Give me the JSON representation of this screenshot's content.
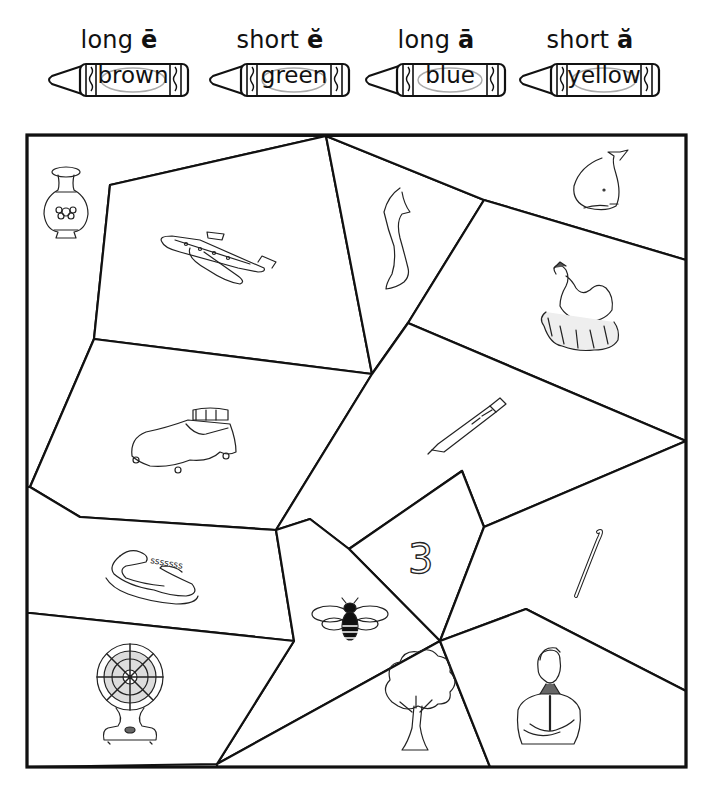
{
  "color_key": [
    {
      "sound": "long",
      "vowel": "ē",
      "color_word": "brown",
      "color": "#8B5A2B"
    },
    {
      "sound": "short",
      "vowel": "ĕ",
      "color_word": "green",
      "color": "#2E8B57"
    },
    {
      "sound": "long",
      "vowel": "ā",
      "color_word": "blue",
      "color": "#2F6FD6"
    },
    {
      "sound": "short",
      "vowel": "ă",
      "color_word": "yellow",
      "color": "#F2D21B"
    }
  ],
  "pictures": [
    {
      "name": "vase",
      "icon": "vase-icon"
    },
    {
      "name": "jet",
      "icon": "jet-icon"
    },
    {
      "name": "leg",
      "icon": "leg-icon"
    },
    {
      "name": "whale",
      "icon": "whale-icon"
    },
    {
      "name": "hen",
      "icon": "hen-icon"
    },
    {
      "name": "bed",
      "icon": "bed-icon"
    },
    {
      "name": "pen",
      "icon": "pen-icon"
    },
    {
      "name": "snake",
      "icon": "snake-icon",
      "hiss": "sssssss"
    },
    {
      "name": "three",
      "icon": "three-icon",
      "numeral": "3"
    },
    {
      "name": "cane",
      "icon": "cane-icon"
    },
    {
      "name": "bee",
      "icon": "bee-icon"
    },
    {
      "name": "fan",
      "icon": "fan-icon"
    },
    {
      "name": "tree",
      "icon": "tree-icon"
    },
    {
      "name": "man",
      "icon": "man-icon"
    }
  ]
}
